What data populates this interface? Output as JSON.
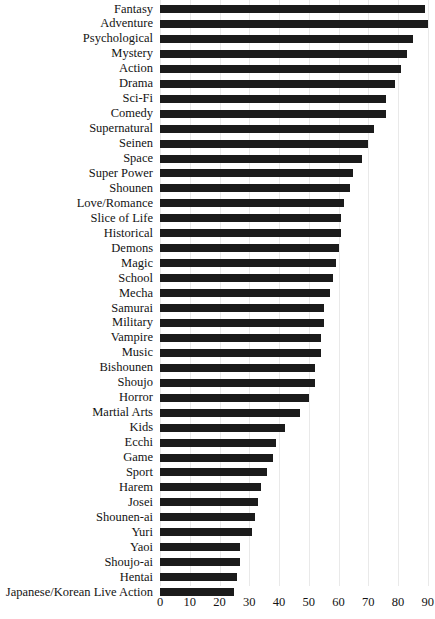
{
  "chart_data": {
    "type": "bar",
    "orientation": "horizontal",
    "title": "",
    "subtitle": "",
    "xlabel": "",
    "ylabel": "",
    "xlim": [
      0,
      92
    ],
    "ylim": [
      0,
      40
    ],
    "grid": true,
    "legend": null,
    "bar_color": "#1b1b1b",
    "xticks": [
      0,
      10,
      20,
      30,
      40,
      50,
      60,
      70,
      80,
      90
    ],
    "xtick_labels": [
      "0",
      "10",
      "20",
      "30",
      "40",
      "50",
      "60",
      "70",
      "80",
      "90"
    ],
    "categories": [
      "Fantasy",
      "Adventure",
      "Psychological",
      "Mystery",
      "Action",
      "Drama",
      "Sci-Fi",
      "Comedy",
      "Supernatural",
      "Seinen",
      "Space",
      "Super Power",
      "Shounen",
      "Love/Romance",
      "Slice of Life",
      "Historical",
      "Demons",
      "Magic",
      "School",
      "Mecha",
      "Samurai",
      "Military",
      "Vampire",
      "Music",
      "Bishounen",
      "Shoujo",
      "Horror",
      "Martial Arts",
      "Kids",
      "Ecchi",
      "Game",
      "Sport",
      "Harem",
      "Josei",
      "Shounen-ai",
      "Yuri",
      "Yaoi",
      "Shoujo-ai",
      "Hentai",
      "Japanese/Korean Live Action"
    ],
    "values": [
      89,
      90,
      85,
      83,
      81,
      79,
      76,
      76,
      72,
      70,
      68,
      65,
      64,
      62,
      61,
      61,
      60,
      59,
      58,
      57,
      55,
      55,
      54,
      54,
      52,
      52,
      50,
      47,
      42,
      39,
      38,
      36,
      34,
      33,
      32,
      31,
      27,
      27,
      26,
      25
    ]
  }
}
